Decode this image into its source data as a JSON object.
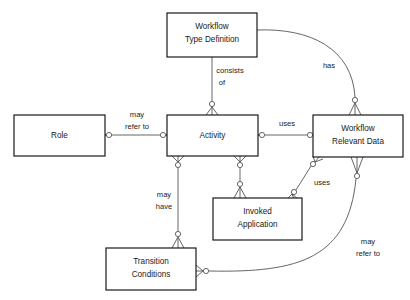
{
  "diagram": {
    "background_color": "#ffffff",
    "box_fill_color": "#ffffff",
    "box_border_color": "#1a1a1a",
    "connector_color": "#555555",
    "entities": [
      {
        "id": "workflow-type-definition",
        "lines": [
          "Workflow",
          "Type Definition"
        ],
        "x": 167,
        "y": 13,
        "w": 90,
        "h": 44
      },
      {
        "id": "role",
        "lines": [
          "Role"
        ],
        "x": 14,
        "y": 115,
        "w": 91,
        "h": 41
      },
      {
        "id": "activity",
        "lines": [
          "Activity"
        ],
        "x": 167,
        "y": 115,
        "w": 91,
        "h": 41
      },
      {
        "id": "workflow-relevant-data",
        "lines": [
          "Workflow",
          "Relevant Data"
        ],
        "x": 313,
        "y": 115,
        "w": 90,
        "h": 42
      },
      {
        "id": "invoked-application",
        "lines": [
          "Invoked",
          "Application"
        ],
        "x": 213,
        "y": 198,
        "w": 89,
        "h": 42
      },
      {
        "id": "transition-conditions",
        "lines": [
          "Transition",
          "Conditions"
        ],
        "x": 106,
        "y": 248,
        "w": 90,
        "h": 42
      }
    ],
    "relationships": [
      {
        "id": "consists-of",
        "lines": [
          "consists",
          "of"
        ],
        "from": "workflow-type-definition",
        "to": "activity",
        "label_x": 230,
        "label_y": 71
      },
      {
        "id": "may-refer-to-role",
        "lines": [
          "may",
          "refer to"
        ],
        "from": "role",
        "to": "activity",
        "label_x": 137,
        "label_y": 115
      },
      {
        "id": "uses-data",
        "lines": [
          "uses"
        ],
        "from": "activity",
        "to": "workflow-relevant-data",
        "label_x": 287,
        "label_y": 124
      },
      {
        "id": "has",
        "lines": [
          "has"
        ],
        "from": "workflow-type-definition",
        "to": "workflow-relevant-data",
        "label_x": 329,
        "label_y": 66
      },
      {
        "id": "may-have",
        "lines": [
          "may",
          "have"
        ],
        "from": "activity",
        "to": "transition-conditions",
        "label_x": 164,
        "label_y": 195
      },
      {
        "id": "uses-invoked-application",
        "lines": [
          "uses"
        ],
        "from": "workflow-relevant-data",
        "to": "invoked-application",
        "label_x": 322,
        "label_y": 183
      },
      {
        "id": "may-refer-to-transition",
        "lines": [
          "may",
          "refer to"
        ],
        "from": "transition-conditions",
        "to": "workflow-relevant-data",
        "label_x": 368,
        "label_y": 242
      }
    ]
  }
}
